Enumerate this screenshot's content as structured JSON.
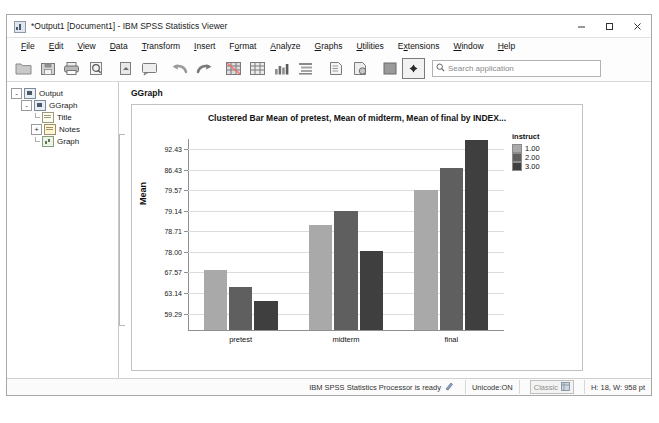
{
  "window": {
    "title": "*Output1 [Document1] - IBM SPSS Statistics Viewer",
    "app_icon": "spss-icon",
    "controls": {
      "minimize": "minimize-icon",
      "maximize": "maximize-icon",
      "close": "close-icon"
    }
  },
  "menu": {
    "items": [
      {
        "label": "File",
        "mnemonic": "F"
      },
      {
        "label": "Edit",
        "mnemonic": "E"
      },
      {
        "label": "View",
        "mnemonic": "V"
      },
      {
        "label": "Data",
        "mnemonic": "D"
      },
      {
        "label": "Transform",
        "mnemonic": "T"
      },
      {
        "label": "Insert",
        "mnemonic": "I"
      },
      {
        "label": "Format",
        "mnemonic": "o"
      },
      {
        "label": "Analyze",
        "mnemonic": "A"
      },
      {
        "label": "Graphs",
        "mnemonic": "G"
      },
      {
        "label": "Utilities",
        "mnemonic": "U"
      },
      {
        "label": "Extensions",
        "mnemonic": "x"
      },
      {
        "label": "Window",
        "mnemonic": "W"
      },
      {
        "label": "Help",
        "mnemonic": "H"
      }
    ]
  },
  "toolbar": {
    "buttons": [
      "open-file-icon",
      "save-icon",
      "print-icon",
      "print-preview-icon",
      "export-icon",
      "dialog-recall-icon",
      "undo-icon",
      "redo-icon",
      "goto-data-icon",
      "variables-icon",
      "run-descriptives-icon",
      "outline-icon",
      "insert-text-icon",
      "insert-object-icon",
      "show-hide-icon",
      "select-marker-icon"
    ],
    "search": {
      "placeholder": "Search application",
      "value": "",
      "icon": "search-icon"
    }
  },
  "outline": {
    "nodes": [
      {
        "label": "Output",
        "icon": "output-icon",
        "depth": 0,
        "expander": "-"
      },
      {
        "label": "GGraph",
        "icon": "ggraph-icon",
        "depth": 1,
        "expander": "-"
      },
      {
        "label": "Title",
        "icon": "title-icon",
        "depth": 2,
        "expander": ""
      },
      {
        "label": "Notes",
        "icon": "notes-icon",
        "depth": 2,
        "expander": "+"
      },
      {
        "label": "Graph",
        "icon": "graph-icon",
        "depth": 2,
        "expander": ""
      }
    ]
  },
  "output": {
    "block_label": "GGraph"
  },
  "chart_data": {
    "type": "bar",
    "title": "Clustered Bar Mean of pretest, Mean of midterm, Mean of final by INDEX...",
    "xlabel": "",
    "ylabel": "Mean",
    "categories": [
      "pretest",
      "midterm",
      "final"
    ],
    "legend_title": "instruct",
    "legend_position": "right",
    "grid": true,
    "series": [
      {
        "name": "1.00",
        "color": "#a9a9a9",
        "values": [
          67.57,
          78.71,
          79.57
        ]
      },
      {
        "name": "2.00",
        "color": "#5f5f5f",
        "values": [
          63.14,
          79.14,
          86.43
        ]
      },
      {
        "name": "3.00",
        "color": "#3f3f3f",
        "values": [
          59.29,
          78.0,
          92.43
        ]
      }
    ],
    "ytick_labels": [
      "92.43",
      "86.43",
      "79.57",
      "79.14",
      "78.71",
      "78.00",
      "67.57",
      "63.14",
      "59.29"
    ],
    "ylim": [
      55.0,
      95.0
    ],
    "bar_fractions": {
      "pretest": [
        0.315,
        0.225,
        0.155
      ],
      "midterm": [
        0.555,
        0.625,
        0.415
      ],
      "final": [
        0.735,
        0.855,
        1.0
      ]
    }
  },
  "statusbar": {
    "ready_text": "IBM SPSS Statistics Processor is ready",
    "ready_icon": "processor-icon",
    "unicode": "Unicode:ON",
    "mode": "Classic",
    "mode_icon": "classic-icon",
    "dimensions": "H: 18, W: 958 pt"
  },
  "colors": {
    "series1": "#a9a9a9",
    "series2": "#5f5f5f",
    "series3": "#3f3f3f",
    "grid": "#dcdcdc",
    "axis": "#8f8f8f"
  }
}
